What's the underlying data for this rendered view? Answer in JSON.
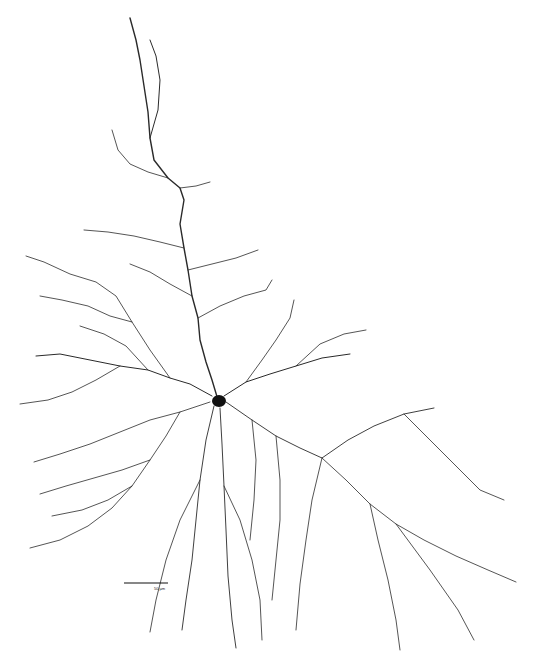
{
  "figure": {
    "scale_bar": {
      "label": "50 µm",
      "length_px": 44
    },
    "colors": {
      "neurite": "#2a2a2a",
      "soma": "#111111",
      "background": "#ffffff"
    }
  }
}
